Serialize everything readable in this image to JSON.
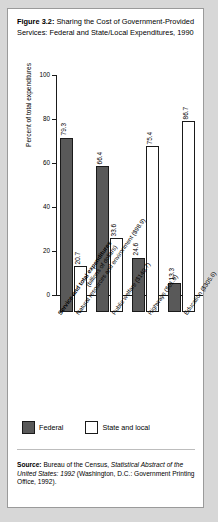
{
  "figure": {
    "title_label": "Figure 3.2:",
    "title_text": " Sharing the Cost of Government-Provided Services: Federal and State/Local Expenditures, 1990"
  },
  "legend": {
    "federal_label": "Federal",
    "state_label": "State and local"
  },
  "source": {
    "label": "Source:",
    "text_1": " Bureau of the Census, ",
    "italic_1": "Statistical Abstract of the United States: 1992",
    "text_2": " (Washington, D.C.: Government Printing Office, 1992)."
  },
  "axis": {
    "header_main": "Service and total expenditures",
    "header_sub": "(billions of dollars)"
  },
  "chart_data": {
    "type": "bar",
    "title": "Sharing the Cost of Government-Provided Services: Federal and State/Local Expenditures, 1990",
    "xlabel": "Service and total expenditures (billions of dollars)",
    "ylabel": "Percent of total expenditures",
    "ylim": [
      0,
      100
    ],
    "yticks": [
      0,
      20,
      40,
      60,
      80,
      100
    ],
    "ytick_labels": [
      "0",
      "20",
      "40",
      "60",
      "80",
      "100"
    ],
    "grid": false,
    "legend_position": "bottom-left",
    "categories": [
      "Natural resources and environment ($98.9)",
      "Public welfare ($140.7)",
      "Highways ($61.9)",
      "Education ($305.6)"
    ],
    "category_names": [
      "Natural resources and environment",
      "Public welfare",
      "Highways",
      "Education"
    ],
    "category_amounts": [
      "$98.9",
      "$140.7",
      "$61.9",
      "$305.6"
    ],
    "series": [
      {
        "name": "Federal",
        "color": "#595959",
        "values": [
          79.3,
          66.4,
          24.6,
          13.3
        ],
        "value_labels": [
          "79.3",
          "66.4",
          "24.6",
          "13.3"
        ]
      },
      {
        "name": "State and local",
        "color": "#ffffff",
        "values": [
          20.7,
          33.6,
          75.4,
          86.7
        ],
        "value_labels": [
          "20.7",
          "33.6",
          "75.4",
          "86.7"
        ]
      }
    ]
  }
}
